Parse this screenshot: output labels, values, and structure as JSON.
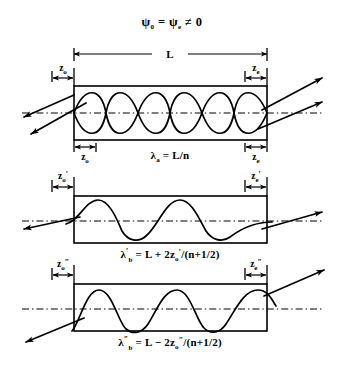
{
  "figure": {
    "title_parts": {
      "psi": "ψ",
      "sub_zero": "0",
      "equals": " = ",
      "psi2": "ψ",
      "sub_e": "e",
      "neq_zero": " ≠ 0"
    }
  },
  "dimensions": {
    "overall_label": "L"
  },
  "panels": [
    {
      "id": "panel-a",
      "left_label": "z",
      "left_sub": "o",
      "left_prime": "",
      "right_label": "z",
      "right_sub": "e",
      "right_prime": "",
      "bottom_left_label": "z",
      "bottom_left_sub": "o",
      "bottom_right_label": "z",
      "bottom_right_sub": "e",
      "formula": "λ",
      "formula_sub": "a",
      "formula_prime": "",
      "formula_rhs": " = L/n",
      "formula_full": "λₐ = L/n",
      "wave_count": 3,
      "wave_mode": "double-crossing"
    },
    {
      "id": "panel-b-prime",
      "left_label": "z",
      "left_sub": "o",
      "left_prime": "′",
      "right_label": "z",
      "right_sub": "e",
      "right_prime": "′",
      "formula": "λ",
      "formula_sub": "b",
      "formula_prime": "′",
      "formula_rhs": " = L + 2z",
      "formula_rhs_sub": "o",
      "formula_rhs_prime": "′",
      "formula_tail": "/(n+1/2)",
      "formula_full": "λ′ᵦ = L + 2z₀′/(n+1/2)",
      "wave_count": 2,
      "wave_mode": "single"
    },
    {
      "id": "panel-b-doubleprime",
      "left_label": "z",
      "left_sub": "o",
      "left_prime": "″",
      "right_label": "z",
      "right_sub": "e",
      "right_prime": "″",
      "formula": "λ",
      "formula_sub": "b",
      "formula_prime": "″",
      "formula_rhs": " = L − 2z",
      "formula_rhs_sub": "o",
      "formula_rhs_prime": "″",
      "formula_tail": "/(n+1/2)",
      "formula_full": "λ″ᵦ = L − 2z₀″/(n+1/2)",
      "wave_count": 2.5,
      "wave_mode": "single"
    }
  ],
  "colors": {
    "ink": "#000000",
    "paper": "#ffffff"
  }
}
